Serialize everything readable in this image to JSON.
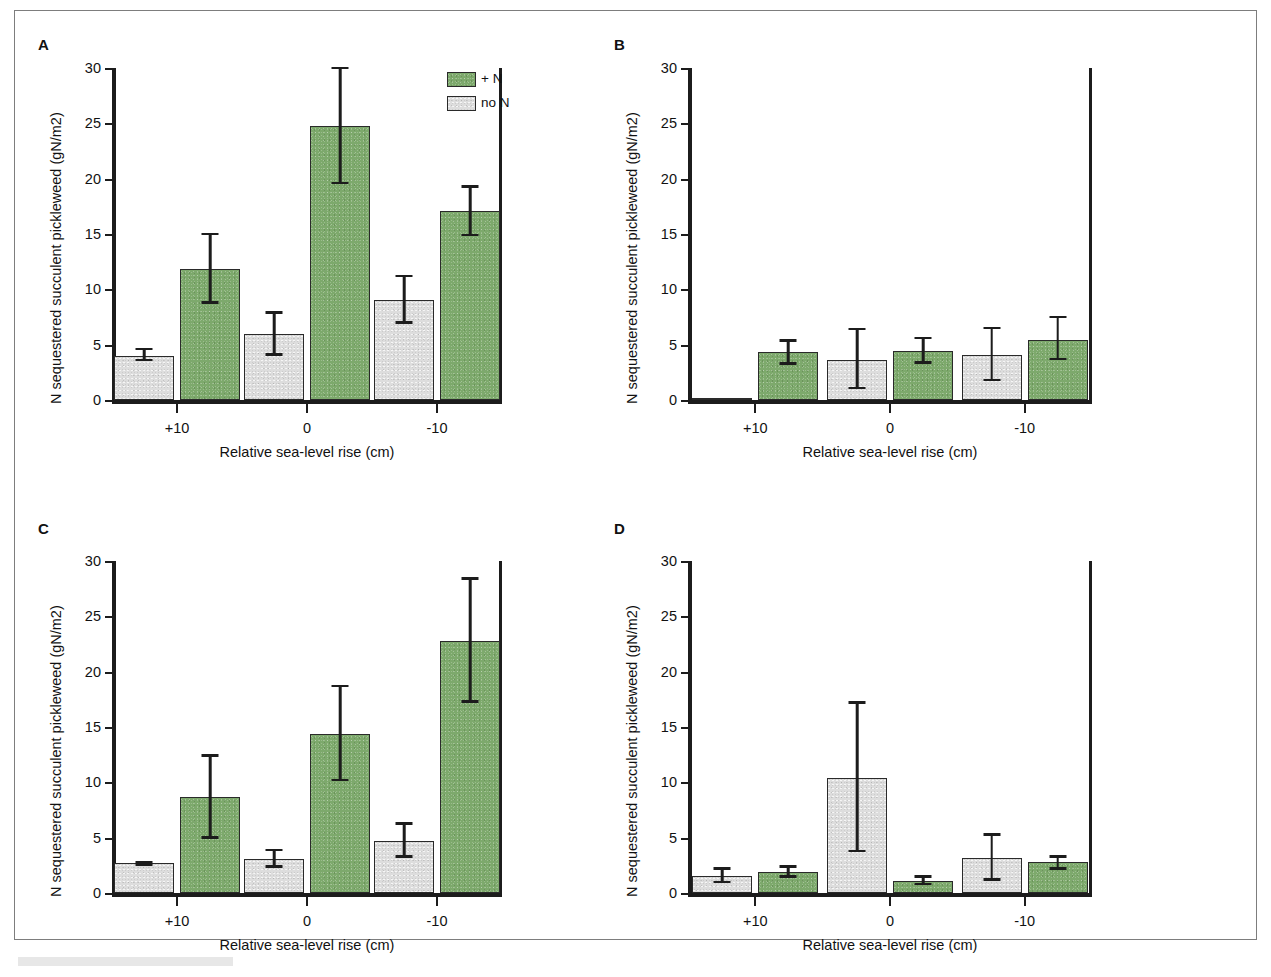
{
  "figure": {
    "panel_letters": [
      "A",
      "B",
      "C",
      "D"
    ],
    "legend": {
      "items": [
        {
          "label": "+ N",
          "color": "#7da96c",
          "key": "plus_n"
        },
        {
          "label": "no N",
          "color": "#dddddd",
          "key": "no_n"
        }
      ]
    },
    "colors": {
      "green": "#7da96c",
      "gray": "#dddddd",
      "axis": "#1c1c1c",
      "frame": "#7d7d7d"
    }
  },
  "chart_data": [
    {
      "type": "bar",
      "panel": "A",
      "title": "",
      "xlabel": "Relative sea-level rise (cm)",
      "ylabel": "N sequestered succulent pickleweed (gN/m2)",
      "categories": [
        "+10",
        "0",
        "-10"
      ],
      "ylim": [
        0,
        30
      ],
      "yticks": [
        0,
        5,
        10,
        15,
        20,
        25,
        30
      ],
      "grid": false,
      "legend_position": "top-right",
      "series": [
        {
          "name": "no N",
          "color": "#dddddd",
          "values": [
            4.0,
            6.0,
            9.0
          ],
          "errors_low": [
            3.6,
            4.1,
            7.0
          ],
          "errors_high": [
            4.6,
            7.9,
            11.2
          ]
        },
        {
          "name": "+ N",
          "color": "#7da96c",
          "values": [
            11.8,
            24.8,
            17.1
          ],
          "errors_low": [
            8.8,
            19.6,
            14.9
          ],
          "errors_high": [
            15.0,
            30.0,
            19.3
          ]
        }
      ]
    },
    {
      "type": "bar",
      "panel": "B",
      "title": "",
      "xlabel": "Relative sea-level rise (cm)",
      "ylabel": "N sequestered succulent pickleweed (gN/m2)",
      "categories": [
        "+10",
        "0",
        "-10"
      ],
      "ylim": [
        0,
        30
      ],
      "yticks": [
        0,
        5,
        10,
        15,
        20,
        25,
        30
      ],
      "grid": false,
      "legend_position": "none",
      "series": [
        {
          "name": "no N",
          "color": "#dddddd",
          "values": [
            0.1,
            3.6,
            4.1
          ],
          "errors_low": [
            0.1,
            1.1,
            1.8
          ],
          "errors_high": [
            0.1,
            6.4,
            6.5
          ]
        },
        {
          "name": "+ N",
          "color": "#7da96c",
          "values": [
            4.3,
            4.4,
            5.4
          ],
          "errors_low": [
            3.3,
            3.4,
            3.7
          ],
          "errors_high": [
            5.4,
            5.6,
            7.5
          ]
        }
      ]
    },
    {
      "type": "bar",
      "panel": "C",
      "title": "",
      "xlabel": "Relative sea-level rise (cm)",
      "ylabel": "N sequestered succulent pickleweed (gN/m2)",
      "categories": [
        "+10",
        "0",
        "-10"
      ],
      "ylim": [
        0,
        30
      ],
      "yticks": [
        0,
        5,
        10,
        15,
        20,
        25,
        30
      ],
      "grid": false,
      "legend_position": "none",
      "series": [
        {
          "name": "no N",
          "color": "#dddddd",
          "values": [
            2.7,
            3.1,
            4.7
          ],
          "errors_low": [
            2.6,
            2.4,
            3.3
          ],
          "errors_high": [
            2.8,
            3.9,
            6.3
          ]
        },
        {
          "name": "+ N",
          "color": "#7da96c",
          "values": [
            8.7,
            14.4,
            22.8
          ],
          "errors_low": [
            5.0,
            10.2,
            17.3
          ],
          "errors_high": [
            12.4,
            18.7,
            28.4
          ]
        }
      ]
    },
    {
      "type": "bar",
      "panel": "D",
      "title": "",
      "xlabel": "Relative sea-level rise (cm)",
      "ylabel": "N sequestered succulent pickleweed (gN/m2)",
      "categories": [
        "+10",
        "0",
        "-10"
      ],
      "ylim": [
        0,
        30
      ],
      "yticks": [
        0,
        5,
        10,
        15,
        20,
        25,
        30
      ],
      "grid": false,
      "legend_position": "none",
      "series": [
        {
          "name": "no N",
          "color": "#dddddd",
          "values": [
            1.5,
            10.4,
            3.2
          ],
          "errors_low": [
            1.0,
            3.8,
            1.2
          ],
          "errors_high": [
            2.2,
            17.2,
            5.3
          ]
        },
        {
          "name": "+ N",
          "color": "#7da96c",
          "values": [
            1.9,
            1.1,
            2.8
          ],
          "errors_low": [
            1.5,
            0.8,
            2.2
          ],
          "errors_high": [
            2.4,
            1.5,
            3.3
          ]
        }
      ]
    }
  ]
}
